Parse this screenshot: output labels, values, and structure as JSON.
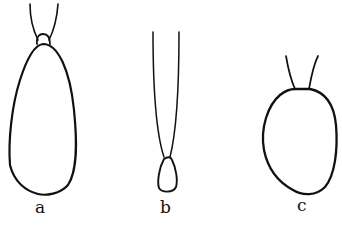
{
  "figure": {
    "background": "#ffffff",
    "ink_color": "#111111",
    "panels": [
      {
        "id": "a",
        "label": "a",
        "description": "elongated teardrop-shaped body with small rounded cap at narrow top end and two diverging stalks above"
      },
      {
        "id": "b",
        "label": "b",
        "description": "small teardrop-shaped body at base of two long nearly parallel stalks"
      },
      {
        "id": "c",
        "label": "c",
        "description": "rounded oval body with two short diverging stalks at top"
      }
    ]
  }
}
